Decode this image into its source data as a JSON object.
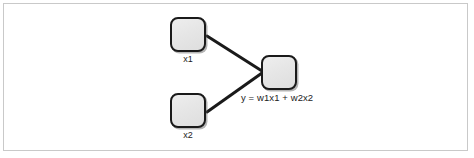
{
  "figure": {
    "type": "node-link-diagram",
    "frame": {
      "border_color": "#c9c9c9",
      "background_color": "#ffffff"
    },
    "style": {
      "node_fill": "#e7e7e7",
      "node_border": "#1a1a1a",
      "edge_color": "#1a1a1a",
      "text_color": "#1c1c1c"
    }
  },
  "nodes": [
    {
      "id": "x1",
      "role": "input",
      "label": "x1",
      "label_position": "below"
    },
    {
      "id": "x2",
      "role": "input",
      "label": "x2",
      "label_position": "below"
    },
    {
      "id": "y",
      "role": "output",
      "label": "y = w1x1 + w2x2",
      "label_position": "below-right"
    }
  ],
  "edges": [
    {
      "from": "x1",
      "to": "y",
      "weight_label": "w1"
    },
    {
      "from": "x2",
      "to": "y",
      "weight_label": "w2"
    }
  ]
}
